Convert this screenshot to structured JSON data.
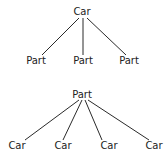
{
  "diagrams": [
    {
      "name": "car-to-parts",
      "root": {
        "label": "Car",
        "x": 82,
        "y": 15
      },
      "children": [
        {
          "label": "Part",
          "x": 36,
          "y": 64
        },
        {
          "label": "Part",
          "x": 83,
          "y": 64
        },
        {
          "label": "Part",
          "x": 129,
          "y": 64
        }
      ],
      "edges": [
        {
          "x1": 79,
          "y1": 18,
          "x2": 42,
          "y2": 55
        },
        {
          "x1": 83,
          "y1": 18,
          "x2": 83,
          "y2": 55
        },
        {
          "x1": 87,
          "y1": 18,
          "x2": 126,
          "y2": 55
        }
      ]
    },
    {
      "name": "part-to-cars",
      "root": {
        "label": "Part",
        "x": 82,
        "y": 98
      },
      "children": [
        {
          "label": "Car",
          "x": 17,
          "y": 149
        },
        {
          "label": "Car",
          "x": 63,
          "y": 149
        },
        {
          "label": "Car",
          "x": 109,
          "y": 149
        },
        {
          "label": "Car",
          "x": 154,
          "y": 149
        }
      ],
      "edges": [
        {
          "x1": 79,
          "y1": 100,
          "x2": 25,
          "y2": 140
        },
        {
          "x1": 82,
          "y1": 100,
          "x2": 63,
          "y2": 140
        },
        {
          "x1": 85,
          "y1": 100,
          "x2": 102,
          "y2": 140
        },
        {
          "x1": 88,
          "y1": 100,
          "x2": 149,
          "y2": 140
        }
      ]
    }
  ]
}
